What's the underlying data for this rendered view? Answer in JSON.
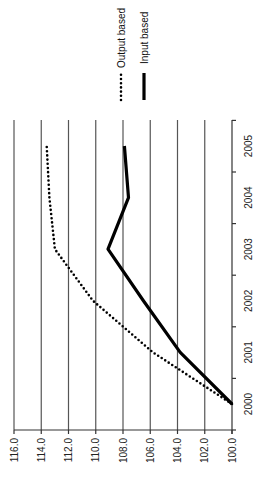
{
  "chart_data": {
    "type": "line",
    "title": "",
    "orientation": "rotated 90 degrees counter-clockwise",
    "xlabel": "",
    "ylabel": "",
    "categories": [
      "2000",
      "2001",
      "2002",
      "2003",
      "2004",
      "2005"
    ],
    "series": [
      {
        "name": "Output based",
        "style": "dotted",
        "color": "#000000",
        "values": [
          100.0,
          105.8,
          110.2,
          113.0,
          113.4,
          113.6
        ]
      },
      {
        "name": "Input based",
        "style": "solid",
        "color": "#000000",
        "values": [
          100.0,
          103.8,
          106.5,
          109.1,
          107.6,
          107.9
        ]
      }
    ],
    "y_ticks": [
      "116.0",
      "114.0",
      "112.0",
      "110.0",
      "108.0",
      "106.0",
      "104.0",
      "102.0",
      "100.0"
    ],
    "ylim": [
      100,
      116
    ],
    "grid": true,
    "legend_position": "top"
  }
}
